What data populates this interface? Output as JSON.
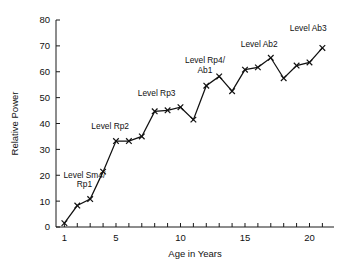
{
  "chart_data": {
    "type": "line",
    "title": "",
    "xlabel": "Age in Years",
    "ylabel": "Relative Power",
    "xlim": [
      0.35,
      21.9
    ],
    "ylim": [
      0,
      80
    ],
    "grid": false,
    "legend": "none",
    "marker": "x",
    "line_color": "#111111",
    "x": [
      1,
      2,
      3,
      4,
      5,
      6,
      7,
      8,
      9,
      10,
      11,
      12,
      13,
      14,
      15,
      16,
      17,
      18,
      19,
      20,
      21
    ],
    "values": [
      1.5,
      8.3,
      10.8,
      21.4,
      33.2,
      33.2,
      35.0,
      44.7,
      45.1,
      46.3,
      41.5,
      54.6,
      58.2,
      52.5,
      60.8,
      61.7,
      65.4,
      57.5,
      62.4,
      63.6,
      69.2
    ],
    "xticks": [
      1,
      2,
      3,
      4,
      5,
      6,
      7,
      8,
      9,
      10,
      11,
      12,
      13,
      14,
      15,
      16,
      17,
      18,
      19,
      20,
      21
    ],
    "xticklabels": [
      {
        "x": 1,
        "label": "1"
      },
      {
        "x": 5,
        "label": "5"
      },
      {
        "x": 10,
        "label": "10"
      },
      {
        "x": 15,
        "label": "15"
      },
      {
        "x": 20,
        "label": "20"
      }
    ],
    "yticks": [
      0,
      10,
      20,
      30,
      40,
      50,
      60,
      70,
      80
    ],
    "yticklabels": [
      "0",
      "10",
      "20",
      "30",
      "40",
      "50",
      "60",
      "70",
      "80"
    ],
    "annotations": [
      {
        "id": "sm4-rp1",
        "lines": [
          "Level Sm4/",
          "Rp1"
        ],
        "x": 2.55,
        "y": 19.0,
        "anchor": "middle"
      },
      {
        "id": "rp2",
        "lines": [
          "Level Rp2"
        ],
        "x": 4.55,
        "y": 38.0,
        "anchor": "middle"
      },
      {
        "id": "rp3",
        "lines": [
          "Level Rp3"
        ],
        "x": 8.15,
        "y": 50.6,
        "anchor": "middle"
      },
      {
        "id": "rp4-ab1",
        "lines": [
          "Level Rp4/",
          "Ab1"
        ],
        "x": 11.9,
        "y": 63.4,
        "anchor": "middle"
      },
      {
        "id": "ab2",
        "lines": [
          "Level Ab2"
        ],
        "x": 16.1,
        "y": 69.7,
        "anchor": "middle"
      },
      {
        "id": "ab3",
        "lines": [
          "Level Ab3"
        ],
        "x": 19.9,
        "y": 75.6,
        "anchor": "middle"
      }
    ]
  }
}
